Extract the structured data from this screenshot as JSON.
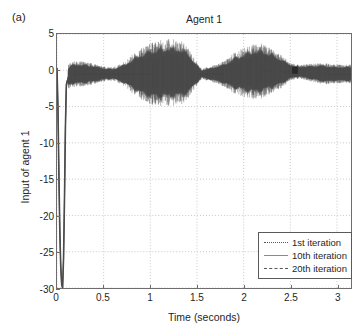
{
  "figure": {
    "panel_label": "(a)",
    "accent_color": "#4a4a4a",
    "grid_color": "#c8c8c8",
    "axis_color": "#6d6d6d"
  },
  "chart_data": {
    "type": "line",
    "title": "Agent 1",
    "xlabel": "Time (seconds)",
    "ylabel": "Input of agent 1",
    "xlim": [
      0,
      3.15
    ],
    "ylim": [
      -30,
      5
    ],
    "xticks": [
      0,
      0.5,
      1,
      1.5,
      2,
      2.5,
      3
    ],
    "xtick_labels": [
      "0",
      "0.5",
      "1",
      "1.5",
      "2",
      "2.5",
      "3"
    ],
    "yticks": [
      5,
      0,
      -5,
      -10,
      -15,
      -20,
      -25,
      -30
    ],
    "ytick_labels": [
      "5",
      "0",
      "-5",
      "-10",
      "-15",
      "-20",
      "-25",
      "-30"
    ],
    "grid": true,
    "legend_position": "lower right",
    "legend": [
      {
        "label": "1st iteration",
        "style": "dotted"
      },
      {
        "label": "10th iteration",
        "style": "dashdot"
      },
      {
        "label": "20th iteration",
        "style": "dashed"
      }
    ],
    "series": [
      {
        "name": "1st iteration",
        "description": "Control input of agent 1, high-frequency oscillatory signal with large initial transient.",
        "initial_transient": {
          "t_min": 0.0,
          "value_min": -30.0,
          "t_recover": 0.11
        },
        "x": [
          0.0,
          0.01,
          0.02,
          0.03,
          0.04,
          0.05,
          0.06,
          0.07,
          0.08,
          0.09,
          0.1,
          0.12,
          0.15,
          0.2,
          0.3,
          0.4,
          0.5,
          0.6,
          0.7,
          0.8,
          0.9,
          1.0,
          1.1,
          1.2,
          1.3,
          1.4,
          1.5,
          1.55,
          1.6,
          1.7,
          1.8,
          1.9,
          2.0,
          2.1,
          2.2,
          2.3,
          2.4,
          2.5,
          2.55,
          2.6,
          2.7,
          2.8,
          2.9,
          3.0,
          3.15
        ],
        "center": [
          0.3,
          -5.0,
          -14.0,
          -22.0,
          -27.0,
          -29.5,
          -30.0,
          -26.0,
          -18.0,
          -8.0,
          -2.0,
          -0.9,
          -0.6,
          -0.5,
          -0.5,
          -0.5,
          -0.5,
          -0.5,
          -0.5,
          -0.5,
          -0.5,
          -0.5,
          -0.4,
          -0.3,
          -0.3,
          -0.4,
          -0.5,
          -0.5,
          -0.5,
          -0.5,
          -0.5,
          -0.4,
          -0.3,
          -0.2,
          -0.1,
          -0.1,
          -0.2,
          -0.2,
          -0.2,
          -0.2,
          -0.3,
          -0.4,
          -0.5,
          -0.5,
          -0.5
        ],
        "envelope": [
          1.4,
          1.2,
          0.9,
          0.6,
          0.4,
          0.3,
          0.2,
          0.2,
          0.3,
          0.6,
          1.0,
          1.3,
          1.4,
          1.4,
          1.3,
          1.1,
          0.8,
          0.7,
          1.2,
          2.0,
          2.8,
          3.3,
          3.5,
          3.6,
          3.5,
          3.0,
          1.2,
          0.5,
          0.7,
          1.0,
          1.4,
          2.2,
          2.6,
          3.0,
          2.9,
          2.4,
          1.8,
          1.0,
          0.8,
          0.7,
          0.9,
          1.1,
          1.1,
          1.0,
          1.0
        ]
      }
    ],
    "annotations": [
      {
        "type": "marker-block",
        "t": 2.55,
        "value": 0.0,
        "note": "small dark solid block near t=2.55"
      }
    ]
  }
}
